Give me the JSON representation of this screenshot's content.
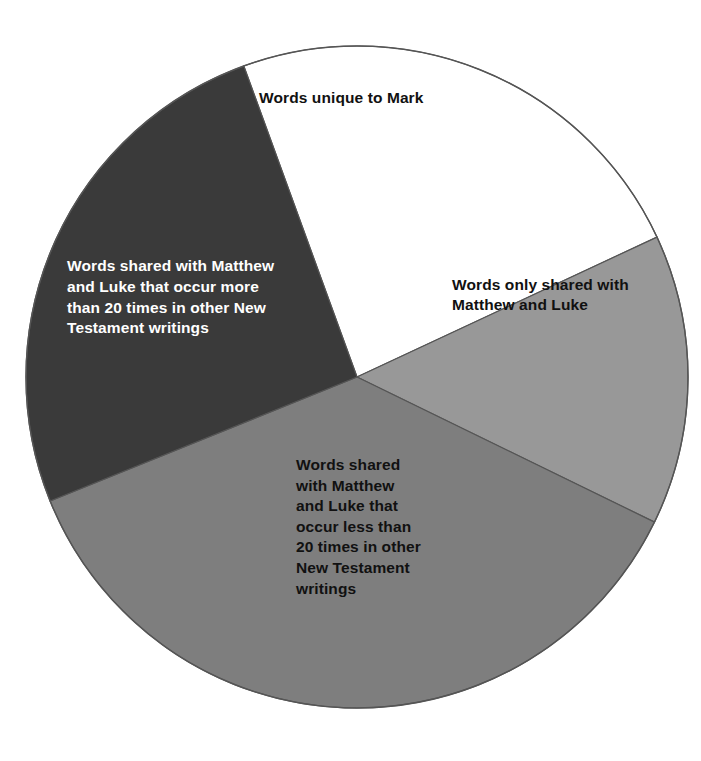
{
  "figure": {
    "background_color": "#ffffff",
    "outline_color": "#555555"
  },
  "chart_data": {
    "type": "pie",
    "title": "",
    "subtitle": "",
    "xlabel": "",
    "ylabel": "",
    "legend_position": "none",
    "grid": false,
    "center": {
      "x": 357,
      "y": 377
    },
    "radius": 331,
    "labels": [
      "Words unique to Mark",
      "Words only shared with Matthew and Luke",
      "Words shared with Matthew and Luke that occur less than 20 times in other New Testament writings",
      "Words shared with Matthew and Luke that occur more than 20 times in other New Testament writings"
    ],
    "values": [
      23.6,
      14.2,
      36.7,
      25.5
    ],
    "colors": [
      "#ffffff",
      "#989898",
      "#7e7e7e",
      "#3a3a3a"
    ],
    "slices": [
      {
        "name": "words-unique-to-mark",
        "label": "Words unique to Mark",
        "label_display": "Words unique to Mark",
        "color": "#ffffff",
        "text_color": "#111111",
        "percent": 23.6,
        "start_angle_deg": -110,
        "end_angle_deg": -25
      },
      {
        "name": "words-only-shared-matthew-luke",
        "label": "Words only shared with Matthew and Luke",
        "label_display": "Words only shared with\nMatthew and Luke",
        "color": "#989898",
        "text_color": "#111111",
        "percent": 14.2,
        "start_angle_deg": -25,
        "end_angle_deg": 26
      },
      {
        "name": "words-shared-less-than-20",
        "label": "Words shared with Matthew and Luke that occur less than 20 times in other New Testament writings",
        "label_display": "Words shared\nwith Matthew\nand Luke that\noccur less than\n20 times in other\nNew Testament\nwritings",
        "color": "#7e7e7e",
        "text_color": "#111111",
        "percent": 36.7,
        "start_angle_deg": 26,
        "end_angle_deg": 158
      },
      {
        "name": "words-shared-more-than-20",
        "label": "Words shared with Matthew and Luke that occur more than 20 times in other New Testament writings",
        "label_display": "Words shared with Matthew\nand Luke that occur more\nthan 20 times in other New\nTestament writings",
        "color": "#3a3a3a",
        "text_color": "#ffffff",
        "percent": 25.5,
        "start_angle_deg": 158,
        "end_angle_deg": 250
      }
    ]
  }
}
